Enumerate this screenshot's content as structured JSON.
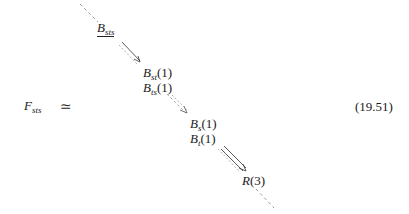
{
  "equation": {
    "lhs": {
      "symbol": "F",
      "subscript": "sts"
    },
    "relation": "≃",
    "number": "(19.51)",
    "nodes": [
      {
        "id": "B_sts",
        "lines": [
          {
            "symbol": "B",
            "subscript": "sts",
            "arg": ""
          }
        ],
        "underlined": true
      },
      {
        "id": "B_st_ts",
        "lines": [
          {
            "symbol": "B",
            "subscript": "st",
            "arg": "(1)"
          },
          {
            "symbol": "B",
            "subscript": "ts",
            "arg": "(1)"
          }
        ]
      },
      {
        "id": "B_s_t",
        "lines": [
          {
            "symbol": "B",
            "subscript": "s",
            "arg": "(1)"
          },
          {
            "symbol": "B",
            "subscript": "t",
            "arg": "(1)"
          }
        ]
      },
      {
        "id": "R3",
        "lines": [
          {
            "symbol": "R",
            "subscript": "",
            "arg": "(3)"
          }
        ]
      }
    ],
    "arrows": [
      {
        "from": "B_sts",
        "to": "B_st_ts",
        "style": "single-with-dashed"
      },
      {
        "from": "B_st_ts",
        "to": "B_s_t",
        "style": "dashed"
      },
      {
        "from": "B_s_t",
        "to": "R3",
        "style": "double"
      }
    ],
    "colors": {
      "ink": "#1a1a1a",
      "dashed": "#9a9a9a"
    }
  }
}
